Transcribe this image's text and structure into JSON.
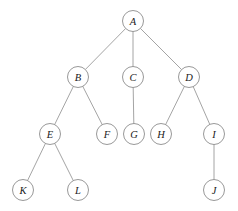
{
  "diagram": {
    "type": "tree",
    "canvas": {
      "width": 238,
      "height": 211,
      "background": "#ffffff"
    },
    "style": {
      "node_radius": 10.5,
      "node_fill": "#ffffff",
      "node_stroke": "#8c8c8c",
      "edge_stroke": "#9a9a9a",
      "label_color": "#1a1a1a"
    },
    "nodes": [
      {
        "id": "A",
        "label": "A",
        "x": 133,
        "y": 21,
        "level": 0,
        "parent": null
      },
      {
        "id": "B",
        "label": "B",
        "x": 78,
        "y": 77,
        "level": 1,
        "parent": "A"
      },
      {
        "id": "C",
        "label": "C",
        "x": 133,
        "y": 77,
        "level": 1,
        "parent": "A"
      },
      {
        "id": "D",
        "label": "D",
        "x": 189,
        "y": 77,
        "level": 1,
        "parent": "A"
      },
      {
        "id": "E",
        "label": "E",
        "x": 50,
        "y": 134,
        "level": 2,
        "parent": "B"
      },
      {
        "id": "F",
        "label": "F",
        "x": 107,
        "y": 134,
        "level": 2,
        "parent": "B"
      },
      {
        "id": "G",
        "label": "G",
        "x": 134,
        "y": 134,
        "level": 2,
        "parent": "C"
      },
      {
        "id": "H",
        "label": "H",
        "x": 161,
        "y": 134,
        "level": 2,
        "parent": "D"
      },
      {
        "id": "I",
        "label": "I",
        "x": 214,
        "y": 134,
        "level": 2,
        "parent": "D"
      },
      {
        "id": "K",
        "label": "K",
        "x": 23,
        "y": 190,
        "level": 3,
        "parent": "E"
      },
      {
        "id": "L",
        "label": "L",
        "x": 78,
        "y": 190,
        "level": 3,
        "parent": "E"
      },
      {
        "id": "J",
        "label": "J",
        "x": 214,
        "y": 190,
        "level": 3,
        "parent": "I"
      }
    ],
    "edges": [
      {
        "from": "A",
        "to": "B"
      },
      {
        "from": "A",
        "to": "C"
      },
      {
        "from": "A",
        "to": "D"
      },
      {
        "from": "B",
        "to": "E"
      },
      {
        "from": "B",
        "to": "F"
      },
      {
        "from": "C",
        "to": "G"
      },
      {
        "from": "D",
        "to": "H"
      },
      {
        "from": "D",
        "to": "I"
      },
      {
        "from": "E",
        "to": "K"
      },
      {
        "from": "E",
        "to": "L"
      },
      {
        "from": "I",
        "to": "J"
      }
    ]
  }
}
